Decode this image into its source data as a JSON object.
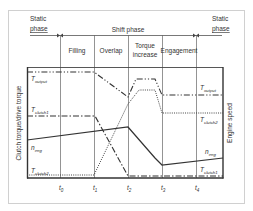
{
  "header": {
    "static_phase_left": [
      "Static",
      "phase"
    ],
    "shift_phase": "Shift phase",
    "static_phase_right": [
      "Static",
      "phase"
    ],
    "sub_phases": [
      "Filling",
      "Overlap",
      "Torque",
      "increase",
      "Engagement"
    ]
  },
  "axes": {
    "y_left_label": "Clutch torque/drive torque",
    "y_right_label": "Engine speed",
    "time_ticks": [
      {
        "main": "t",
        "sub": "0"
      },
      {
        "main": "t",
        "sub": "1"
      },
      {
        "main": "t",
        "sub": "2"
      },
      {
        "main": "t",
        "sub": "3"
      },
      {
        "main": "t",
        "sub": "4"
      }
    ]
  },
  "curves": {
    "t_output": {
      "main": "T",
      "sub": "output",
      "style": "dash-dot-dot"
    },
    "t_clutch1": {
      "main": "T",
      "sub": "clutch1",
      "style": "dash-dot"
    },
    "n_eng": {
      "main": "n",
      "sub": "eng",
      "style": "solid"
    },
    "t_clutch2": {
      "main": "T",
      "sub": "clutch2",
      "style": "dotted"
    }
  },
  "colors": {
    "line": "#333333",
    "frame": "#444444",
    "outer_border": "#cccccc",
    "grid": "#555555"
  }
}
